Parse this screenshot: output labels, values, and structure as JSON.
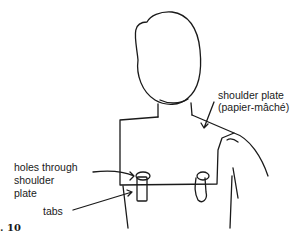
{
  "figure": {
    "number_label": ". 10",
    "labels": {
      "shoulder_plate_line1": "shoulder plate",
      "shoulder_plate_line2": "(papier-mâché)",
      "holes_line1": "holes through",
      "holes_line2": "shoulder",
      "holes_line3": "plate",
      "tabs": "tabs"
    },
    "colors": {
      "ink": "#1a1a1a",
      "background": "#ffffff"
    }
  }
}
